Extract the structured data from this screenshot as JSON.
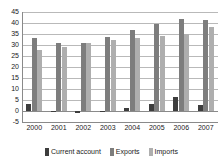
{
  "chart_data": {
    "type": "bar",
    "title": "",
    "subtitle": "",
    "xlabel": "",
    "ylabel": "",
    "categories": [
      "2000",
      "2001",
      "2002",
      "2003",
      "2004",
      "2005",
      "2006",
      "2007"
    ],
    "series": [
      {
        "name": "Current account",
        "color": "#3d3d3d",
        "values": [
          3.0,
          0.2,
          -0.7,
          0.2,
          1.3,
          3.4,
          6.2,
          2.7
        ]
      },
      {
        "name": "Exports",
        "color": "#7d7d7d",
        "values": [
          33.0,
          31.0,
          30.8,
          33.8,
          36.6,
          39.6,
          41.6,
          41.2
        ]
      },
      {
        "name": "Imports",
        "color": "#aeaeae",
        "values": [
          27.7,
          29.0,
          30.8,
          32.3,
          33.3,
          34.0,
          35.2,
          38.2
        ]
      }
    ],
    "ylim": [
      -5,
      45
    ],
    "ytick_labels": [
      "45",
      "40",
      "35",
      "30",
      "25",
      "20",
      "15",
      "10",
      "5",
      "0",
      "-5"
    ],
    "ytick_values": [
      45,
      40,
      35,
      30,
      25,
      20,
      15,
      10,
      5,
      0,
      -5
    ],
    "grid": true,
    "legend_position": "bottom"
  }
}
